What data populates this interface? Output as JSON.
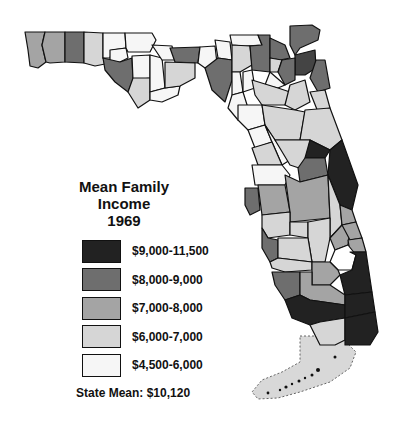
{
  "legend": {
    "title_line1": "Mean Family Income",
    "title_line2": "1969",
    "items": [
      {
        "label": "$9,000-11,500",
        "color": "#222222"
      },
      {
        "label": "$8,000-9,000",
        "color": "#6e6e6e"
      },
      {
        "label": "$7,000-8,000",
        "color": "#a4a4a4"
      },
      {
        "label": "$6,000-7,000",
        "color": "#d6d6d6"
      },
      {
        "label": "$4,500-6,000",
        "color": "#f6f6f6"
      }
    ],
    "state_mean": "State Mean: $10,120"
  },
  "map": {
    "subject": "Florida counties",
    "background": "#ffffff",
    "outline_color": "#111111"
  }
}
